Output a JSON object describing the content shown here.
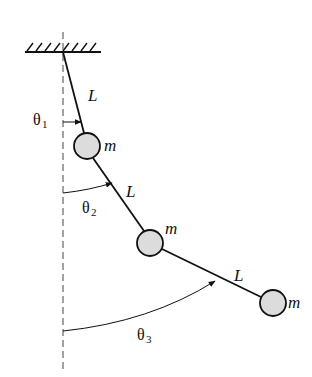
{
  "diagram": {
    "title": "",
    "type": "triple-pendulum",
    "colors": {
      "line": "#111111",
      "mass_fill": "#dcdcdc",
      "reference_line": "#444444",
      "background": "#ffffff"
    },
    "support": {
      "label": ""
    },
    "links": [
      {
        "label": "L"
      },
      {
        "label": "L"
      },
      {
        "label": "L"
      }
    ],
    "masses": [
      {
        "label": "m"
      },
      {
        "label": "m"
      },
      {
        "label": "m"
      }
    ],
    "angles": [
      {
        "symbol": "θ",
        "subscript": "1"
      },
      {
        "symbol": "θ",
        "subscript": "2"
      },
      {
        "symbol": "θ",
        "subscript": "3"
      }
    ]
  }
}
